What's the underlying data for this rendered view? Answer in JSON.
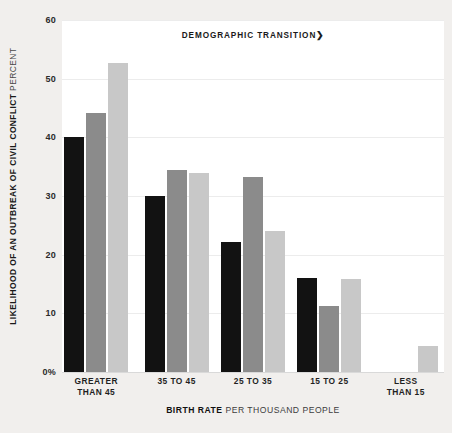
{
  "annotation": {
    "label": "DEMOGRAPHIC TRANSITION",
    "arrow": "❯"
  },
  "y_axis": {
    "title_main": "LIKELIHOOD OF AN OUTBREAK OF CIVIL CONFLICT",
    "title_unit": "PERCENT",
    "ticks": [
      "60",
      "50",
      "40",
      "30",
      "20",
      "10",
      "0%"
    ]
  },
  "x_axis": {
    "title_main": "BIRTH RATE",
    "title_unit": "PER THOUSAND PEOPLE",
    "tick_lines": [
      [
        "GREATER",
        "THAN 45"
      ],
      [
        "35 TO 45"
      ],
      [
        "25 TO 35"
      ],
      [
        "15 TO 25"
      ],
      [
        "LESS",
        "THAN 15"
      ]
    ]
  },
  "colors": {
    "background": "#f1efed",
    "plot_background": "#ffffff",
    "gridline": "#ececec",
    "series_dark": "#121212",
    "series_medium": "#8b8b8b",
    "series_light": "#c8c8c8"
  },
  "chart_data": {
    "type": "bar",
    "title": "",
    "xlabel": "BIRTH RATE PER THOUSAND PEOPLE",
    "ylabel": "LIKELIHOOD OF AN OUTBREAK OF CIVIL CONFLICT PERCENT",
    "ylim": [
      0,
      60
    ],
    "yticks": [
      0,
      10,
      20,
      30,
      40,
      50,
      60
    ],
    "grid": true,
    "legend": "none",
    "annotation": "DEMOGRAPHIC TRANSITION",
    "categories": [
      "GREATER THAN 45",
      "35 TO 45",
      "25 TO 35",
      "15 TO 25",
      "LESS THAN 15"
    ],
    "series": [
      {
        "name": "series-1-dark",
        "color": "#121212",
        "values": [
          40.0,
          30.0,
          22.2,
          16.0,
          0
        ]
      },
      {
        "name": "series-2-medium",
        "color": "#8b8b8b",
        "values": [
          44.2,
          34.4,
          33.2,
          11.3,
          0
        ]
      },
      {
        "name": "series-3-light",
        "color": "#c8c8c8",
        "values": [
          52.6,
          34.0,
          24.0,
          15.8,
          4.5
        ]
      }
    ]
  }
}
